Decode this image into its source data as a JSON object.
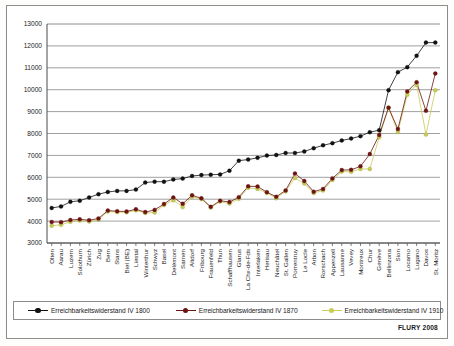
{
  "figure": {
    "source_note": "FLURY 2008",
    "frame_border_color": "#8c8c8c"
  },
  "legend": {
    "position": "bottom",
    "entries": [
      {
        "label": "Erreichbarkeitswiderstand IV 1800",
        "color": "#111111"
      },
      {
        "label": "Erreichbarkeitswiderstand IV 1870",
        "color": "#6b1410"
      },
      {
        "label": "Erreichbarkeitswiderstand IV 1910",
        "color": "#c8cc54"
      }
    ]
  },
  "chart_data": {
    "type": "line",
    "title": "",
    "xlabel": "",
    "ylabel": "",
    "ylim": [
      3000,
      13000
    ],
    "ytick_step": 1000,
    "yticks": [
      3000,
      4000,
      5000,
      6000,
      7000,
      8000,
      9000,
      10000,
      11000,
      12000,
      13000
    ],
    "ytick_labels": [
      "3000",
      "4000",
      "5000",
      "6000",
      "7000",
      "8000",
      "9000",
      "10000",
      "11000",
      "12000",
      "13000"
    ],
    "grid": true,
    "grid_axis": "y",
    "legend_position": "bottom",
    "categories": [
      "Olten",
      "Aarau",
      "Luzern",
      "Solothurn",
      "Zürich",
      "Zug",
      "Bern",
      "Stans",
      "Biel (BE)",
      "Liestal",
      "Winterthur",
      "Schwyz",
      "Basel",
      "Delémont",
      "Sarnen",
      "Altdorf",
      "Fribourg",
      "Frauenfeld",
      "Thun",
      "Schaffhausen",
      "Glarus",
      "La Chx-de-Fds",
      "Interlaken",
      "Herisau",
      "Neuchâtel",
      "St. Gallen",
      "Porrentruy",
      "Le Locle",
      "Arbon",
      "Rorschach",
      "Appenzell",
      "Lausanne",
      "Vevey",
      "Montreux",
      "Chur",
      "Genève",
      "Bellinzona",
      "Sion",
      "Locarno",
      "Lugano",
      "Davos",
      "St. Moritz"
    ],
    "series": [
      {
        "name": "Erreichbarkeitswiderstand IV 1800",
        "color": "#111111",
        "values": [
          4600,
          4670,
          4880,
          4930,
          5080,
          5230,
          5330,
          5380,
          5380,
          5440,
          5760,
          5800,
          5800,
          5900,
          5940,
          6060,
          6100,
          6120,
          6130,
          6300,
          6760,
          6810,
          6890,
          6990,
          7020,
          7110,
          7110,
          7180,
          7330,
          7460,
          7560,
          7680,
          7770,
          7880,
          8060,
          8150,
          9980,
          10800,
          11030,
          11550,
          12150,
          12150
        ]
      },
      {
        "name": "Erreichbarkeitswiderstand IV 1870",
        "color": "#6b1410",
        "values": [
          3960,
          3950,
          4050,
          4080,
          4040,
          4120,
          4480,
          4450,
          4440,
          4540,
          4410,
          4510,
          4780,
          5080,
          4790,
          5180,
          5040,
          4650,
          4930,
          4870,
          5090,
          5590,
          5580,
          5320,
          5110,
          5400,
          6170,
          5830,
          5340,
          5470,
          5950,
          6330,
          6340,
          6500,
          7060,
          7930,
          9180,
          8200,
          9920,
          10340,
          9040,
          10740
        ]
      },
      {
        "name": "Erreichbarkeitswiderstand IV 1910",
        "color": "#c8cc54",
        "values": [
          3790,
          3830,
          3970,
          4030,
          3980,
          4070,
          4440,
          4410,
          4400,
          4490,
          4370,
          4390,
          4730,
          4950,
          4640,
          5110,
          5010,
          4620,
          4890,
          4800,
          5020,
          5520,
          5470,
          5290,
          5040,
          5360,
          5970,
          5720,
          5280,
          5400,
          5880,
          6260,
          6250,
          6380,
          6380,
          7830,
          9180,
          8070,
          9770,
          10230,
          7950,
          9980
        ]
      }
    ]
  }
}
